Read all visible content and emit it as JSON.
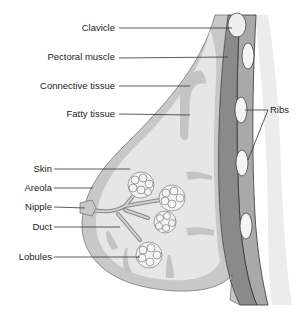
{
  "diagram": {
    "labels": {
      "clavicle": "Clavicle",
      "pectoral_muscle": "Pectoral muscle",
      "connective_tissue": "Connective tissue",
      "fatty_tissue": "Fatty tissue",
      "ribs": "Ribs",
      "skin": "Skin",
      "areola": "Areola",
      "nipple": "Nipple",
      "duct": "Duct",
      "lobules": "Lobules"
    },
    "colors": {
      "skin_band": "#c8c8c8",
      "connective": "#b9b9b9",
      "fatty": "#e6e6e6",
      "muscle": "#8a8a8a",
      "rib_band": "#a9a9a9",
      "bone": "#f4f4f4",
      "line": "#333333"
    }
  }
}
